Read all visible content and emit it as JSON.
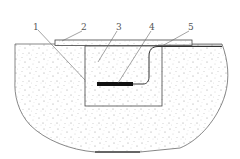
{
  "diagram": {
    "type": "cross-section technical drawing",
    "colors": {
      "background": "#ffffff",
      "line": "#555555",
      "fill_speckle": "#8a8a8a",
      "element_4": "#111111"
    },
    "callouts": [
      {
        "id": "1",
        "label": "1",
        "target": "inner-box-lower-left"
      },
      {
        "id": "2",
        "label": "2",
        "target": "top-cover-plate"
      },
      {
        "id": "3",
        "label": "3",
        "target": "filled-pit-interior"
      },
      {
        "id": "4",
        "label": "4",
        "target": "embedded-black-element"
      },
      {
        "id": "5",
        "label": "5",
        "target": "cable-lead"
      }
    ]
  }
}
